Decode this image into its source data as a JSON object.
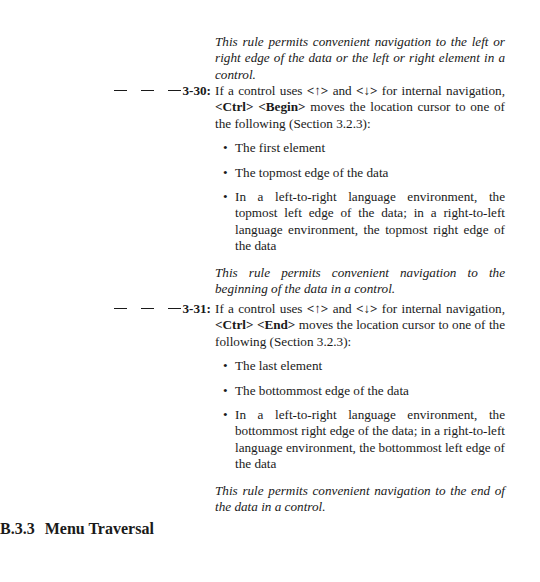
{
  "intro_note": "This rule permits convenient navigation to the left or right edge of the data or the left or right element in a control.",
  "rules": [
    {
      "id": "3-30:",
      "text_prefix": "If a control uses ",
      "key_up": "<↑>",
      "text_and": " and ",
      "key_down": "<↓>",
      "text_mid": " for internal navigation, ",
      "combo_1": "<Ctrl>",
      "combo_2": "<Begin>",
      "text_suffix": " moves the location cursor to one of the following (Section 3.2.3):",
      "bullets": [
        "The first element",
        "The topmost edge of the data",
        "In a left-to-right language environment, the topmost left edge of the data; in a right-to-left language environment, the topmost right edge of the data"
      ],
      "note": "This rule permits convenient navigation to the beginning of the data in a control."
    },
    {
      "id": "3-31:",
      "text_prefix": "If a control uses ",
      "key_up": "<↑>",
      "text_and": " and ",
      "key_down": "<↓>",
      "text_mid": " for internal navigation, ",
      "combo_1": "<Ctrl>",
      "combo_2": "<End>",
      "text_suffix": " moves the location cursor to one of the following (Section 3.2.3):",
      "bullets": [
        "The last element",
        "The bottommost edge of the data",
        "In a left-to-right language environment, the bottommost right edge of the data; in a right-to-left language environment, the bottommost left edge of the data"
      ],
      "note": "This rule permits convenient navigation to the end of the data in a control."
    }
  ],
  "bullet_glyph": "•",
  "section": {
    "number": "B.3.3",
    "title": "Menu Traversal"
  }
}
